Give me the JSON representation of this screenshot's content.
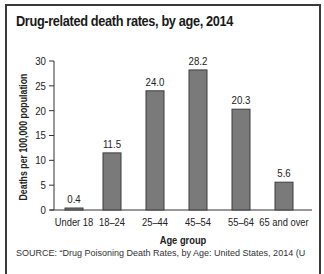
{
  "chart_data": {
    "type": "bar",
    "title": "Drug-related death rates, by age, 2014",
    "xlabel": "Age group",
    "ylabel": "Deaths per 100,000 population",
    "categories": [
      "Under 18",
      "18–24",
      "25–44",
      "45–54",
      "55–64",
      "65 and over"
    ],
    "values": [
      0.4,
      11.5,
      24.0,
      28.2,
      20.3,
      5.6
    ],
    "value_labels": [
      "0.4",
      "11.5",
      "24.0",
      "28.2",
      "20.3",
      "5.6"
    ],
    "ylim": [
      0,
      30
    ],
    "yticks": [
      0,
      5,
      10,
      15,
      20,
      25,
      30
    ],
    "grid": false,
    "legend": "none",
    "colors": {
      "bar_fill": "#7a7a7a",
      "bar_stroke": "#3d3d3d",
      "axis": "#333333"
    }
  },
  "source_note": "SOURCE: “Drug Poisoning Death Rates, by Age: United States, 2014 (U"
}
